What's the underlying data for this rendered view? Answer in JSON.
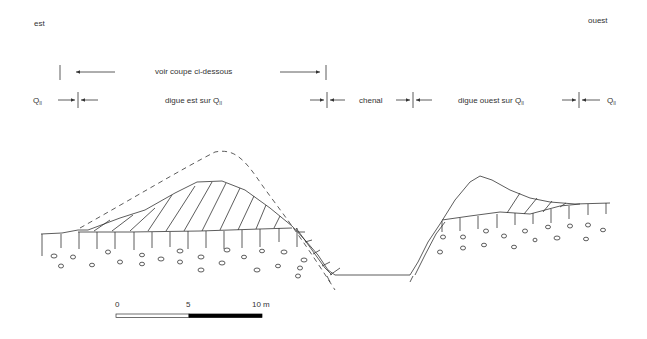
{
  "orientation": {
    "left": "est",
    "right": "ouest"
  },
  "annotations": {
    "row1": {
      "label": "voir coupe ci-dessous"
    },
    "row2": {
      "q_left": {
        "base": "Q",
        "sub": "II"
      },
      "digue_est": {
        "text": "digue est sur Q",
        "sub": "II"
      },
      "chenal": "chenal",
      "digue_ouest": {
        "text": "digue ouest sur Q",
        "sub": "II"
      },
      "q_right": {
        "base": "Q",
        "sub": "II"
      }
    }
  },
  "scale_bar": {
    "ticks": [
      "0",
      "5",
      "10 m"
    ],
    "colors": {
      "first_half": "#ffffff",
      "second_half": "#000000"
    }
  },
  "legend_elements": {
    "dashed_line": "former levee profile (dashed)",
    "hatched": "levee deposits (hatched)",
    "pebbles": "substrate gravels (ovals)"
  },
  "colors": {
    "line": "#333333",
    "background": "#ffffff"
  }
}
